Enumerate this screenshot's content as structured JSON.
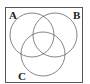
{
  "diagram": {
    "type": "venn",
    "sets": [
      {
        "label": "A",
        "cx": 32,
        "cy": 35,
        "r": 22
      },
      {
        "label": "B",
        "cx": 55,
        "cy": 35,
        "r": 22
      },
      {
        "label": "C",
        "cx": 43,
        "cy": 54,
        "r": 22
      }
    ],
    "universe": {
      "x": 5,
      "y": 7,
      "width": 78,
      "height": 75
    },
    "line_color": "#555555"
  }
}
